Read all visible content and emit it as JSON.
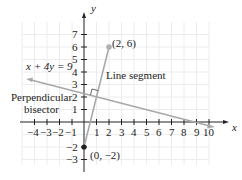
{
  "figure": {
    "axis_x_label": "x",
    "axis_y_label": "y",
    "x_ticks": [
      "−4",
      "−3",
      "−2",
      "−1",
      "1",
      "2",
      "3",
      "4",
      "5",
      "6",
      "7",
      "8",
      "9",
      "10"
    ],
    "y_ticks": [
      "7",
      "6",
      "5",
      "4",
      "3",
      "2",
      "1",
      "−2",
      "−3"
    ],
    "point_a_label": "(2, 6)",
    "point_b_label": "(0, −2)",
    "equation_label": "x + 4y = 9",
    "segment_label": "Line segment",
    "bisector_label_line1": "Perpendicular",
    "bisector_label_line2": "bisector"
  },
  "colors": {
    "axis": "#222222",
    "grid": "#ececec",
    "line": "#a8a8a8",
    "point": "#b0b0b0"
  }
}
